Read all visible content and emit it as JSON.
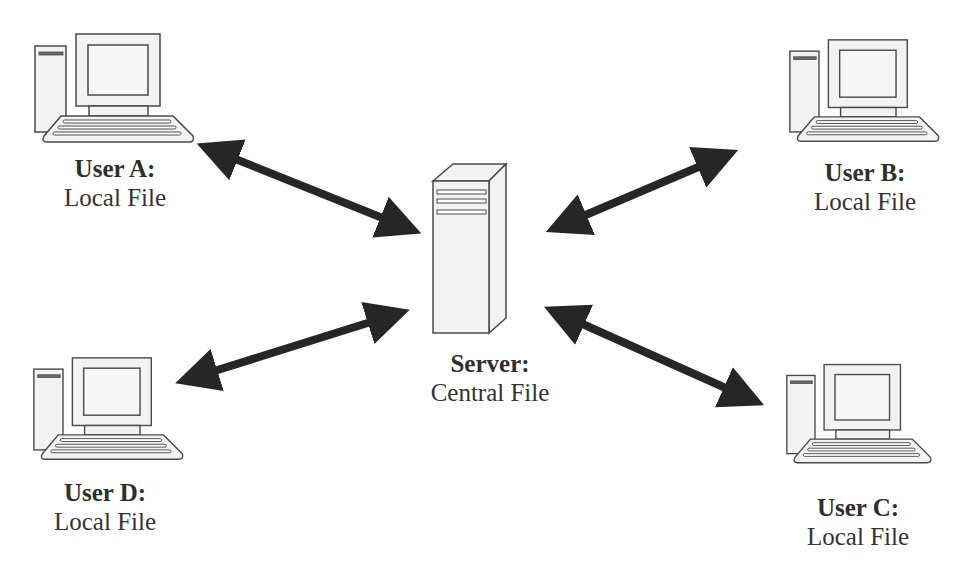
{
  "diagram": {
    "type": "client-server file sharing",
    "colors": {
      "background": "#ffffff",
      "arrow": "#262626",
      "icon_stroke": "#4a4a4a",
      "icon_fill": "#f2f2f2",
      "text": "#333333"
    },
    "server": {
      "title": "Server:",
      "subtitle": "Central File",
      "icon": "server-tower-icon"
    },
    "users": [
      {
        "id": "A",
        "title": "User A:",
        "subtitle": "Local File",
        "icon": "desktop-computer-icon"
      },
      {
        "id": "B",
        "title": "User B:",
        "subtitle": "Local File",
        "icon": "desktop-computer-icon"
      },
      {
        "id": "C",
        "title": "User C:",
        "subtitle": "Local File",
        "icon": "desktop-computer-icon"
      },
      {
        "id": "D",
        "title": "User D:",
        "subtitle": "Local File",
        "icon": "desktop-computer-icon"
      }
    ],
    "connections": [
      {
        "from": "User A",
        "to": "Server",
        "type": "bidirectional-arrow"
      },
      {
        "from": "User B",
        "to": "Server",
        "type": "bidirectional-arrow"
      },
      {
        "from": "User C",
        "to": "Server",
        "type": "bidirectional-arrow"
      },
      {
        "from": "User D",
        "to": "Server",
        "type": "bidirectional-arrow"
      }
    ]
  }
}
